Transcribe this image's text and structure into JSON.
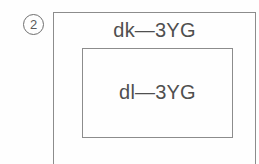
{
  "figure": {
    "marker_label": "②",
    "marker_number": "2",
    "outer_box": {
      "label": "dk—3YG",
      "label_prefix": "dk",
      "label_separator": "—",
      "label_suffix": "3YG"
    },
    "inner_box": {
      "label": "dl—3YG",
      "label_prefix": "dl",
      "label_separator": "—",
      "label_suffix": "3YG"
    },
    "colors": {
      "background": "#fefefe",
      "stroke": "#8c8c8c",
      "marker_stroke": "#6e6e6e",
      "text": "#4f4f4f",
      "marker_text": "#5a5a5a"
    }
  }
}
